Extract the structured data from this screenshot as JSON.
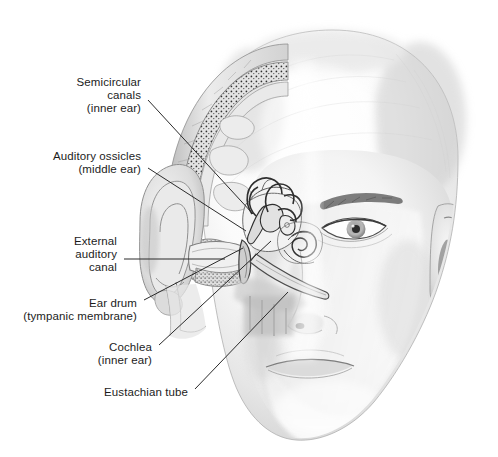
{
  "figure": {
    "background_color": "#ffffff",
    "text_color": "#1c1c1c",
    "leader_line_color": "#2b2b2b",
    "width": 498,
    "height": 457
  },
  "labels": [
    {
      "id": "semicircular-canals",
      "lines": [
        "Semicircular",
        "canals",
        "(inner ear)"
      ],
      "line1": "Semicircular",
      "line2": "canals",
      "line3": "(inner ear)",
      "right_x": 141,
      "top_y": 76,
      "leader": {
        "x1": 148,
        "y1": 100,
        "x2": 253,
        "y2": 214
      }
    },
    {
      "id": "auditory-ossicles",
      "lines": [
        "Auditory ossicles",
        "(middle ear)"
      ],
      "line1": "Auditory ossicles",
      "line2": "(middle ear)",
      "right_x": 141,
      "top_y": 150,
      "leader": {
        "x1": 148,
        "y1": 168,
        "x2": 246,
        "y2": 231
      }
    },
    {
      "id": "external-auditory-canal",
      "lines": [
        "External",
        "auditory",
        "canal"
      ],
      "line1": "External",
      "line2": "auditory",
      "line3": "canal",
      "right_x": 117,
      "top_y": 235,
      "leader": {
        "x1": 124,
        "y1": 259,
        "x2": 225,
        "y2": 259
      }
    },
    {
      "id": "ear-drum",
      "lines": [
        "Ear drum",
        "(tympanic membrane)"
      ],
      "line1": "Ear drum",
      "line2": "(tympanic membrane)",
      "right_x": 137,
      "top_y": 297,
      "leader": {
        "x1": 144,
        "y1": 300,
        "x2": 243,
        "y2": 248
      }
    },
    {
      "id": "cochlea",
      "lines": [
        "Cochlea",
        "(inner ear)"
      ],
      "line1": "Cochlea",
      "line2": "(inner ear)",
      "right_x": 152,
      "top_y": 341,
      "leader": {
        "x1": 159,
        "y1": 345,
        "x2": 271,
        "y2": 241
      }
    },
    {
      "id": "eustachian-tube",
      "lines": [
        "Eustachian tube"
      ],
      "line1": "Eustachian tube",
      "right_x": 188,
      "top_y": 386,
      "leader": {
        "x1": 195,
        "y1": 389,
        "x2": 288,
        "y2": 292
      }
    }
  ],
  "anatomy_regions": [
    {
      "name": "head-outline",
      "description": "bald head, three-quarter front view, pencil shading"
    },
    {
      "name": "skull-cutaway",
      "description": "temporal bone cutaway with diploe stippling at upper left of head"
    },
    {
      "name": "pinna",
      "description": "left outer ear shown in section"
    },
    {
      "name": "ear-canal",
      "description": "external auditory canal leading inward"
    },
    {
      "name": "tympanic-membrane",
      "description": "ear drum at inner end of canal"
    },
    {
      "name": "ossicles",
      "description": "malleus, incus and stapes of the middle ear"
    },
    {
      "name": "semicircular-canals",
      "description": "three looping canals of the inner ear"
    },
    {
      "name": "cochlea",
      "description": "spiral organ of hearing"
    },
    {
      "name": "eustachian-tube",
      "description": "tube running down toward the nasopharynx"
    },
    {
      "name": "right-ear",
      "description": "intact outer ear on the far side of the head"
    },
    {
      "name": "eye",
      "description": "right eye with brow"
    },
    {
      "name": "nose",
      "description": "nose with nostril"
    },
    {
      "name": "mouth",
      "description": "lips"
    }
  ]
}
